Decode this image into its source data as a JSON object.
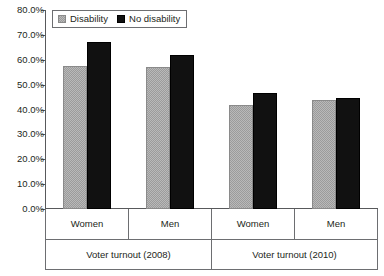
{
  "chart_data": {
    "type": "bar",
    "title": "",
    "xlabel": "",
    "ylabel": "",
    "ylim": [
      0,
      80
    ],
    "ytick_labels": [
      "0.0%",
      "10.0%",
      "20.0%",
      "30.0%",
      "40.0%",
      "50.0%",
      "60.0%",
      "70.0%",
      "80.0%"
    ],
    "ytick_values": [
      0,
      10,
      20,
      30,
      40,
      50,
      60,
      70,
      80
    ],
    "grid": false,
    "legend_position": "top-left",
    "categories": [
      "Women",
      "Men",
      "Women",
      "Men"
    ],
    "group_labels": [
      "Voter turnout (2008)",
      "Voter turnout (2010)"
    ],
    "series": [
      {
        "name": "Disability",
        "color": "#9b9b9b",
        "values": [
          57.5,
          57.0,
          42.0,
          43.8
        ]
      },
      {
        "name": "No disability",
        "color": "#111111",
        "values": [
          67.0,
          62.0,
          46.7,
          44.7
        ]
      }
    ]
  },
  "legend": {
    "items": [
      {
        "label": "Disability"
      },
      {
        "label": "No disability"
      }
    ]
  }
}
